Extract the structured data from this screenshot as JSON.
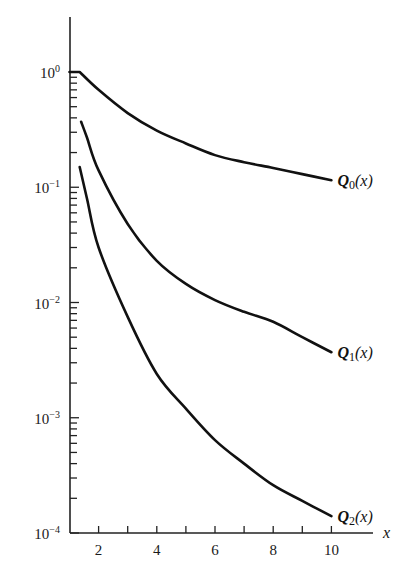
{
  "chart_data": {
    "type": "line",
    "title": "",
    "xlabel": "x",
    "ylabel": "",
    "yscale": "log",
    "xlim": [
      1,
      11.5
    ],
    "ylim": [
      0.0001,
      3
    ],
    "grid": false,
    "legend": "inline labels at right end of each curve",
    "x_ticks": [
      2,
      4,
      6,
      8,
      10
    ],
    "x_tick_labels": [
      "2",
      "4",
      "6",
      "8",
      "10"
    ],
    "y_ticks": [
      1,
      0.1,
      0.01,
      0.001,
      0.0001
    ],
    "y_tick_labels": [
      {
        "base": "10",
        "exp": "0"
      },
      {
        "base": "10",
        "exp": "−1"
      },
      {
        "base": "10",
        "exp": "−2"
      },
      {
        "base": "10",
        "exp": "−3"
      },
      {
        "base": "10",
        "exp": "−4"
      }
    ],
    "series": [
      {
        "name": "Q0(x)",
        "label_main": "Q",
        "label_sub": "0",
        "label_arg": "(x)",
        "x": [
          1.0,
          1.35,
          2,
          3,
          4,
          5,
          6,
          7,
          8,
          9,
          10
        ],
        "values": [
          1.0,
          1.0,
          0.7,
          0.44,
          0.31,
          0.24,
          0.19,
          0.165,
          0.147,
          0.13,
          0.115
        ]
      },
      {
        "name": "Q1(x)",
        "label_main": "Q",
        "label_sub": "1",
        "label_arg": "(x)",
        "x": [
          1.4,
          1.6,
          2,
          3,
          4,
          5,
          6,
          7,
          8,
          9,
          10
        ],
        "values": [
          0.37,
          0.27,
          0.14,
          0.048,
          0.023,
          0.0145,
          0.0105,
          0.0083,
          0.0068,
          0.005,
          0.0037
        ]
      },
      {
        "name": "Q2(x)",
        "label_main": "Q",
        "label_sub": "2",
        "label_arg": "(x)",
        "x": [
          1.35,
          1.6,
          2,
          3,
          4,
          5,
          6,
          7,
          8,
          9,
          10
        ],
        "values": [
          0.15,
          0.08,
          0.03,
          0.0075,
          0.0024,
          0.0012,
          0.00064,
          0.0004,
          0.00026,
          0.00019,
          0.00014
        ]
      }
    ]
  }
}
